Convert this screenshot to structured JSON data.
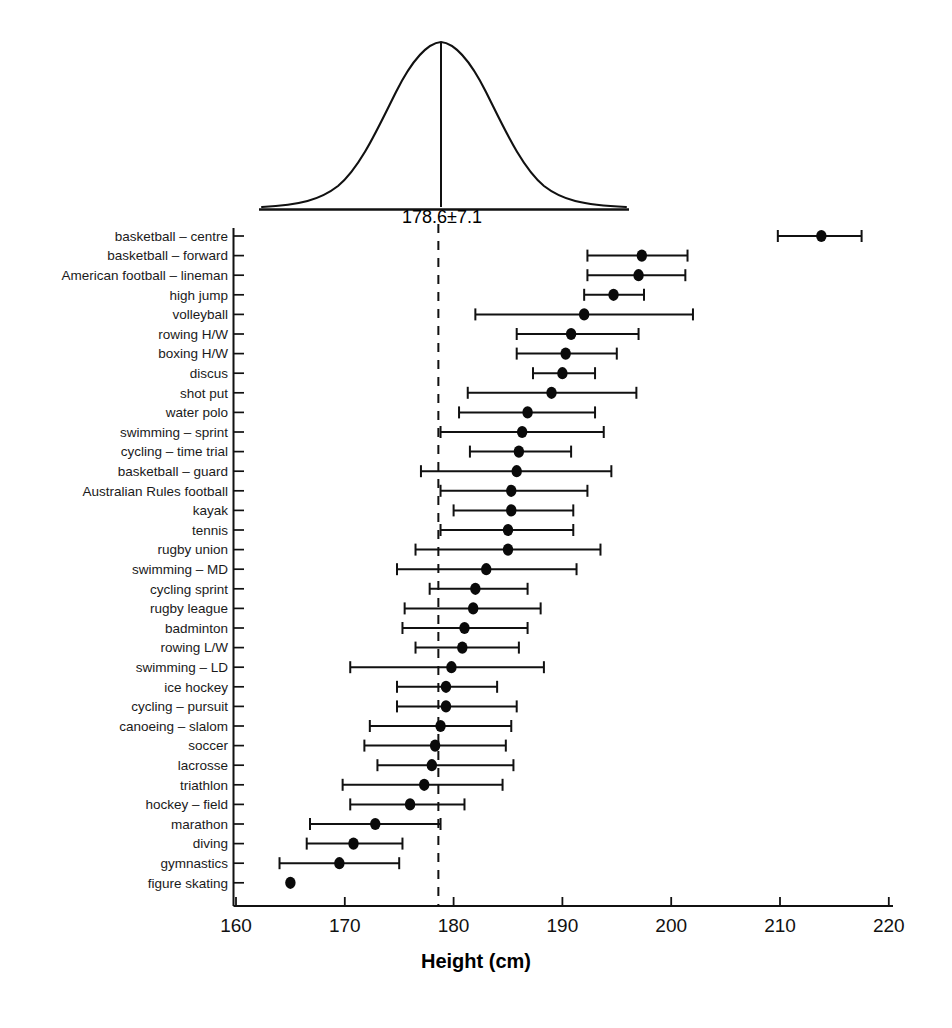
{
  "chart_data": {
    "type": "scatter",
    "title": "",
    "xlabel": "Height (cm)",
    "ylabel": "",
    "xlim": [
      160,
      220
    ],
    "xticks": [
      160,
      170,
      180,
      190,
      200,
      210,
      220
    ],
    "grid": false,
    "legend": null,
    "reference_line": {
      "label": "178.6±7.1",
      "mean": 178.6,
      "sd": 7.1,
      "style": "dashed"
    },
    "distribution_curve": {
      "label": "178.6±7.1",
      "mean": 178.6,
      "sd": 7.1,
      "shape": "normal"
    },
    "error_bar_note": "horizontal mean ± range bars",
    "categories": [
      "basketball – centre",
      "basketball – forward",
      "American football – lineman",
      "high jump",
      "volleyball",
      "rowing H/W",
      "boxing H/W",
      "discus",
      "shot put",
      "water polo",
      "swimming – sprint",
      "cycling – time trial",
      "basketball – guard",
      "Australian Rules football",
      "kayak",
      "tennis",
      "rugby union",
      "swimming – MD",
      "cycling  sprint",
      "rugby league",
      "badminton",
      "rowing L/W",
      "swimming – LD",
      "ice hockey",
      "cycling – pursuit",
      "canoeing – slalom",
      "soccer",
      "lacrosse",
      "triathlon",
      "hockey – field",
      "marathon",
      "diving",
      "gymnastics",
      "figure skating"
    ],
    "points": [
      {
        "label": "basketball – centre",
        "mean": 213.8,
        "low": 209.8,
        "high": 217.5
      },
      {
        "label": "basketball – forward",
        "mean": 197.3,
        "low": 192.3,
        "high": 201.5
      },
      {
        "label": "American football – lineman",
        "mean": 197.0,
        "low": 192.3,
        "high": 201.3
      },
      {
        "label": "high jump",
        "mean": 194.7,
        "low": 192.0,
        "high": 197.5
      },
      {
        "label": "volleyball",
        "mean": 192.0,
        "low": 182.0,
        "high": 202.0
      },
      {
        "label": "rowing H/W",
        "mean": 190.8,
        "low": 185.8,
        "high": 197.0
      },
      {
        "label": "boxing H/W",
        "mean": 190.3,
        "low": 185.8,
        "high": 195.0
      },
      {
        "label": "discus",
        "mean": 190.0,
        "low": 187.3,
        "high": 193.0
      },
      {
        "label": "shot put",
        "mean": 189.0,
        "low": 181.3,
        "high": 196.8
      },
      {
        "label": "water polo",
        "mean": 186.8,
        "low": 180.5,
        "high": 193.0
      },
      {
        "label": "swimming – sprint",
        "mean": 186.3,
        "low": 178.8,
        "high": 193.8
      },
      {
        "label": "cycling – time trial",
        "mean": 186.0,
        "low": 181.5,
        "high": 190.8
      },
      {
        "label": "basketball – guard",
        "mean": 185.8,
        "low": 177.0,
        "high": 194.5
      },
      {
        "label": "Australian Rules football",
        "mean": 185.3,
        "low": 178.8,
        "high": 192.3
      },
      {
        "label": "kayak",
        "mean": 185.3,
        "low": 180.0,
        "high": 191.0
      },
      {
        "label": "tennis",
        "mean": 185.0,
        "low": 178.8,
        "high": 191.0
      },
      {
        "label": "rugby union",
        "mean": 185.0,
        "low": 176.5,
        "high": 193.5
      },
      {
        "label": "swimming – MD",
        "mean": 183.0,
        "low": 174.8,
        "high": 191.3
      },
      {
        "label": "cycling  sprint",
        "mean": 182.0,
        "low": 177.8,
        "high": 186.8
      },
      {
        "label": "rugby league",
        "mean": 181.8,
        "low": 175.5,
        "high": 188.0
      },
      {
        "label": "badminton",
        "mean": 181.0,
        "low": 175.3,
        "high": 186.8
      },
      {
        "label": "rowing L/W",
        "mean": 180.8,
        "low": 176.5,
        "high": 186.0
      },
      {
        "label": "swimming – LD",
        "mean": 179.8,
        "low": 170.5,
        "high": 188.3
      },
      {
        "label": "ice hockey",
        "mean": 179.3,
        "low": 174.8,
        "high": 184.0
      },
      {
        "label": "cycling – pursuit",
        "mean": 179.3,
        "low": 174.8,
        "high": 185.8
      },
      {
        "label": "canoeing – slalom",
        "mean": 178.8,
        "low": 172.3,
        "high": 185.3
      },
      {
        "label": "soccer",
        "mean": 178.3,
        "low": 171.8,
        "high": 184.8
      },
      {
        "label": "lacrosse",
        "mean": 178.0,
        "low": 173.0,
        "high": 185.5
      },
      {
        "label": "triathlon",
        "mean": 177.3,
        "low": 169.8,
        "high": 184.5
      },
      {
        "label": "hockey – field",
        "mean": 176.0,
        "low": 170.5,
        "high": 181.0
      },
      {
        "label": "marathon",
        "mean": 172.8,
        "low": 166.8,
        "high": 178.8
      },
      {
        "label": "diving",
        "mean": 170.8,
        "low": 166.5,
        "high": 175.3
      },
      {
        "label": "gymnastics",
        "mean": 169.5,
        "low": 164.0,
        "high": 175.0
      },
      {
        "label": "figure skating",
        "mean": 165.0,
        "low": null,
        "high": null
      }
    ]
  },
  "axis": {
    "tick_labels": [
      "160",
      "170",
      "180",
      "190",
      "200",
      "210",
      "220"
    ],
    "title": "Height (cm)"
  },
  "curve": {
    "mean_label": "178.6±7.1"
  }
}
